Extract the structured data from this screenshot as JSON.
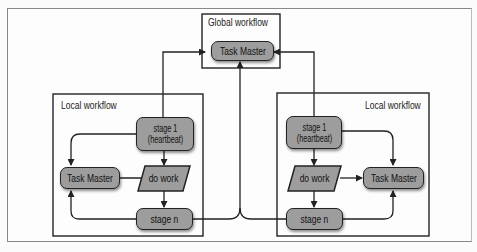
{
  "global": {
    "title": "Global workflow",
    "task_master": "Task Master"
  },
  "local_left": {
    "title": "Local workflow",
    "stage1_line1": "stage 1",
    "stage1_line2": "(heartbeat)",
    "do_work": "do work",
    "task_master": "Task Master",
    "stage_n": "stage n"
  },
  "local_right": {
    "title": "Local workflow",
    "stage1_line1": "stage 1",
    "stage1_line2": "(heartbeat)",
    "do_work": "do work",
    "task_master": "Task Master",
    "stage_n": "stage n"
  },
  "colors": {
    "node_fill": "#9d9d9d",
    "stroke": "#222222",
    "background": "#fbfbfb"
  }
}
